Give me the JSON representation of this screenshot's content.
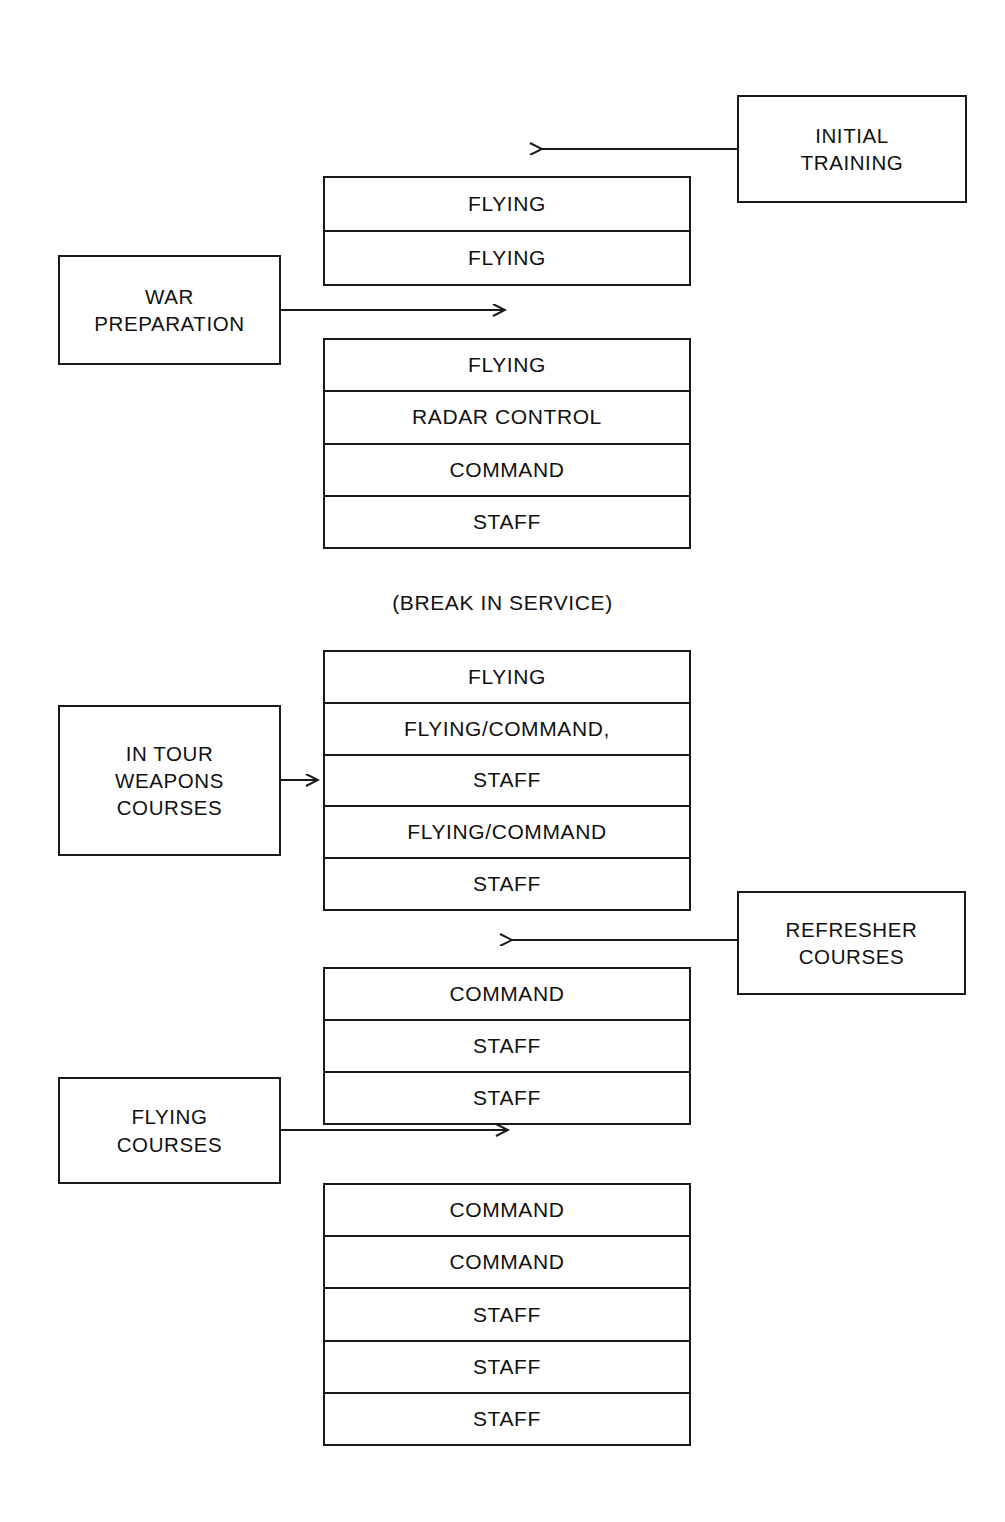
{
  "diagram": {
    "caption_break": "(BREAK IN SERVICE)",
    "line_color": "#1a1a1a",
    "background_color": "#ffffff"
  },
  "side_boxes": {
    "initial_training": "INITIAL\nTRAINING",
    "war_preparation": "WAR\nPREPARATION",
    "in_tour_weapons_courses": "IN TOUR\nWEAPONS\nCOURSES",
    "refresher_courses": "REFRESHER\nCOURSES",
    "flying_courses": "FLYING\nCOURSES"
  },
  "stacks": [
    {
      "id": "stack-1",
      "rows": [
        "FLYING",
        "FLYING"
      ]
    },
    {
      "id": "stack-2",
      "rows": [
        "FLYING",
        "RADAR CONTROL",
        "COMMAND",
        "STAFF"
      ]
    },
    {
      "id": "stack-3",
      "rows": [
        "FLYING",
        "FLYING/COMMAND,",
        "STAFF",
        "FLYING/COMMAND",
        "STAFF"
      ]
    },
    {
      "id": "stack-4",
      "rows": [
        "COMMAND",
        "STAFF",
        "STAFF"
      ]
    },
    {
      "id": "stack-5",
      "rows": [
        "COMMAND",
        "COMMAND",
        "STAFF",
        "STAFF",
        "STAFF"
      ]
    }
  ],
  "arrows": [
    {
      "name": "initial-training-arrow",
      "direction": "left"
    },
    {
      "name": "war-preparation-arrow",
      "direction": "right"
    },
    {
      "name": "in-tour-weapons-arrow",
      "direction": "right"
    },
    {
      "name": "refresher-courses-arrow",
      "direction": "left"
    },
    {
      "name": "flying-courses-arrow",
      "direction": "right"
    }
  ]
}
